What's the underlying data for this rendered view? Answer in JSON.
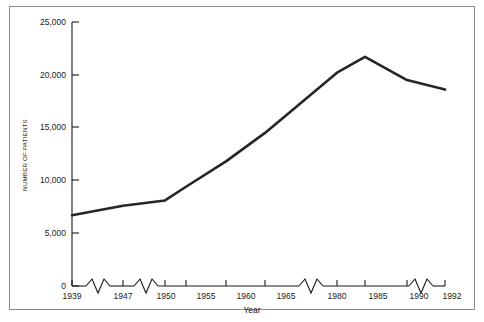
{
  "figure": {
    "border_color": "#8b8b8b",
    "background": "#ffffff"
  },
  "chart_data": {
    "type": "line",
    "title": "",
    "subtitle": "",
    "xlabel": "Year",
    "ylabel": "NUMBER OF PATIENTS",
    "categories": [
      "1939",
      "1947",
      "1950",
      "1955",
      "1960",
      "1965",
      "1980",
      "1985",
      "1990",
      "1992"
    ],
    "x": [
      1939,
      1947,
      1950,
      1955,
      1960,
      1965,
      1980,
      1985,
      1990,
      1992
    ],
    "values": [
      6700,
      7600,
      8100,
      9400,
      11800,
      14500,
      20200,
      21700,
      19500,
      18600
    ],
    "series": [
      {
        "name": "Number of patients",
        "color": "#262626",
        "values": [
          6700,
          7600,
          8100,
          9400,
          11800,
          14500,
          20200,
          21700,
          19500,
          18600
        ]
      }
    ],
    "xlim": [
      1939,
      1992
    ],
    "ylim": [
      0,
      25000
    ],
    "ytick_labels": [
      "0",
      "5,000",
      "10,000",
      "15,000",
      "20,000",
      "25,000"
    ],
    "ytick_values": [
      0,
      5000,
      10000,
      15000,
      20000,
      25000
    ],
    "xtick_labels": [
      "1939",
      "1947",
      "1950",
      "1955",
      "1960",
      "1965",
      "1980",
      "1985",
      "1990",
      "1992"
    ],
    "grid": false,
    "legend": false,
    "legend_position": "none",
    "axis_breaks": {
      "axis": "x",
      "note": "zigzag break symbols on the x-axis indicate compressed/skipped year intervals",
      "count": 4,
      "between": [
        [
          "1939",
          "1947"
        ],
        [
          "1947",
          "1950"
        ],
        [
          "1965",
          "1980"
        ],
        [
          "1990",
          "1992"
        ]
      ]
    },
    "annotations": []
  },
  "axes": {
    "y_axis_title": "NUMBER OF PATIENTS",
    "x_axis_title": "Year"
  }
}
